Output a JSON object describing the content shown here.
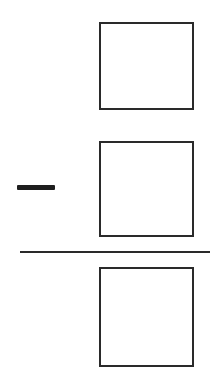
{
  "problem": {
    "operation": "subtraction",
    "operator_symbol": "minus-icon",
    "minuend_box": {
      "value": ""
    },
    "subtrahend_box": {
      "value": ""
    },
    "answer_box": {
      "value": ""
    }
  },
  "colors": {
    "stroke": "#2a2a2a",
    "background": "#ffffff"
  }
}
